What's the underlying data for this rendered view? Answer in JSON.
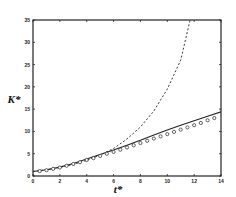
{
  "chart_data": {
    "type": "line",
    "title": "",
    "xlabel": "t*",
    "ylabel": "K*",
    "xlim": [
      0,
      14
    ],
    "ylim": [
      0,
      35
    ],
    "xticks": [
      0,
      2,
      4,
      6,
      8,
      10,
      12,
      14
    ],
    "yticks": [
      0,
      5,
      10,
      15,
      20,
      25,
      30,
      35
    ],
    "grid": false,
    "legend": null,
    "series": [
      {
        "name": "solid",
        "style": "solid",
        "x": [
          0,
          1,
          2,
          3,
          4,
          5,
          6,
          7,
          8,
          9,
          10,
          11,
          12,
          13,
          14
        ],
        "y": [
          1.0,
          1.4,
          2.0,
          2.8,
          3.8,
          4.8,
          5.8,
          6.9,
          8.0,
          9.2,
          10.3,
          11.4,
          12.4,
          13.4,
          14.4
        ]
      },
      {
        "name": "dashed",
        "style": "dashed",
        "x": [
          0,
          1,
          2,
          3,
          4,
          5,
          6,
          7,
          8,
          9,
          10,
          11,
          11.7
        ],
        "y": [
          1.0,
          1.4,
          1.9,
          2.6,
          3.5,
          4.7,
          6.2,
          8.3,
          11.0,
          14.6,
          19.5,
          26.0,
          35.0
        ]
      },
      {
        "name": "circles",
        "style": "markers",
        "x": [
          0.5,
          1,
          1.5,
          2,
          2.5,
          3,
          3.5,
          4,
          4.5,
          5,
          5.5,
          6,
          6.5,
          7,
          7.5,
          8,
          8.5,
          9,
          9.5,
          10,
          10.5,
          11,
          11.5,
          12,
          12.5,
          13,
          13.5
        ],
        "y": [
          1.1,
          1.3,
          1.6,
          1.9,
          2.3,
          2.7,
          3.1,
          3.6,
          4.0,
          4.5,
          5.0,
          5.4,
          5.9,
          6.4,
          6.9,
          7.4,
          7.9,
          8.4,
          8.9,
          9.4,
          9.9,
          10.4,
          10.9,
          11.4,
          11.9,
          12.5,
          13.0
        ]
      }
    ]
  }
}
